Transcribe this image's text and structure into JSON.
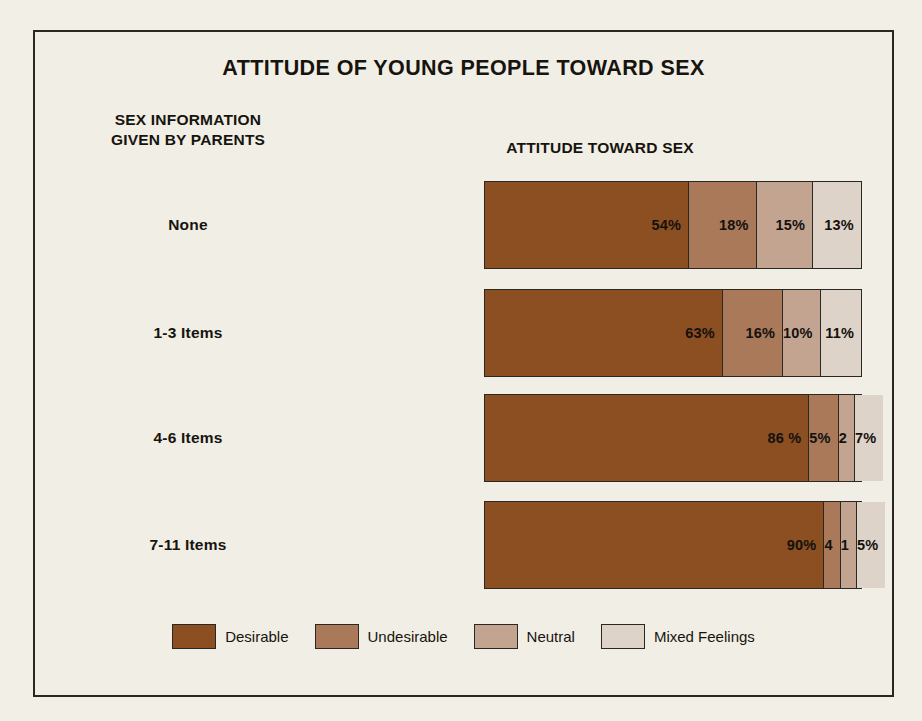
{
  "chart_data": {
    "type": "bar",
    "subtype": "stacked-horizontal-100",
    "title": "ATTITUDE OF YOUNG PEOPLE TOWARD SEX",
    "row_axis_title": "SEX INFORMATION\nGIVEN BY PARENTS",
    "row_axis_title_line1": "SEX INFORMATION",
    "row_axis_title_line2": "GIVEN BY PARENTS",
    "value_axis_title": "ATTITUDE TOWARD SEX",
    "xlabel": "",
    "ylabel": "",
    "xlim": [
      0,
      100
    ],
    "grid": false,
    "legend_position": "bottom",
    "categories": [
      "None",
      "1-3 Items",
      "4-6 Items",
      "7-11 Items"
    ],
    "series": [
      {
        "name": "Desirable",
        "color": "#8b4f22",
        "values": [
          54,
          63,
          86,
          90
        ],
        "labels": [
          "54%",
          "63%",
          "86 %",
          "90%"
        ]
      },
      {
        "name": "Undesirable",
        "color": "#a9795a",
        "values": [
          18,
          16,
          5,
          4
        ],
        "labels": [
          "18%",
          "16%",
          "5%",
          "4"
        ]
      },
      {
        "name": "Neutral",
        "color": "#c3a491",
        "values": [
          15,
          10,
          2,
          1
        ],
        "labels": [
          "15%",
          "10%",
          "2",
          "1"
        ]
      },
      {
        "name": "Mixed Feelings",
        "color": "#ded3c8",
        "values": [
          13,
          11,
          7,
          5
        ],
        "labels": [
          "13%",
          "11%",
          "7%",
          "5%"
        ]
      }
    ],
    "rows": [
      {
        "category": "None",
        "segments": [
          {
            "name": "Desirable",
            "value": 54,
            "label": "54%",
            "color": "#8b4f22"
          },
          {
            "name": "Undesirable",
            "value": 18,
            "label": "18%",
            "color": "#a9795a"
          },
          {
            "name": "Neutral",
            "value": 15,
            "label": "15%",
            "color": "#c3a491"
          },
          {
            "name": "Mixed Feelings",
            "value": 13,
            "label": "13%",
            "color": "#ded3c8"
          }
        ]
      },
      {
        "category": "1-3 Items",
        "segments": [
          {
            "name": "Desirable",
            "value": 63,
            "label": "63%",
            "color": "#8b4f22"
          },
          {
            "name": "Undesirable",
            "value": 16,
            "label": "16%",
            "color": "#a9795a"
          },
          {
            "name": "Neutral",
            "value": 10,
            "label": "10%",
            "color": "#c3a491"
          },
          {
            "name": "Mixed Feelings",
            "value": 11,
            "label": "11%",
            "color": "#ded3c8"
          }
        ]
      },
      {
        "category": "4-6 Items",
        "segments": [
          {
            "name": "Desirable",
            "value": 86,
            "label": "86 %",
            "color": "#8b4f22"
          },
          {
            "name": "Undesirable",
            "value": 5,
            "label": "5%",
            "color": "#a9795a"
          },
          {
            "name": "Neutral",
            "value": 2,
            "label": "2",
            "color": "#c3a491"
          },
          {
            "name": "Mixed Feelings",
            "value": 7,
            "label": "7%",
            "color": "#ded3c8"
          }
        ]
      },
      {
        "category": "7-11 Items",
        "segments": [
          {
            "name": "Desirable",
            "value": 90,
            "label": "90%",
            "color": "#8b4f22"
          },
          {
            "name": "Undesirable",
            "value": 4,
            "label": "4",
            "color": "#a9795a"
          },
          {
            "name": "Neutral",
            "value": 1,
            "label": "1",
            "color": "#c3a491"
          },
          {
            "name": "Mixed Feelings",
            "value": 5,
            "label": "5%",
            "color": "#ded3c8"
          }
        ]
      }
    ],
    "legend": [
      {
        "label": "Desirable",
        "color": "#8b4f22"
      },
      {
        "label": "Undesirable",
        "color": "#a9795a"
      },
      {
        "label": "Neutral",
        "color": "#c3a491"
      },
      {
        "label": "Mixed Feelings",
        "color": "#ded3c8"
      }
    ]
  },
  "style": {
    "background": "#f1eee5",
    "page_background": "#f2efe7",
    "border_color": "#2b2722",
    "text_color": "#17140f"
  }
}
